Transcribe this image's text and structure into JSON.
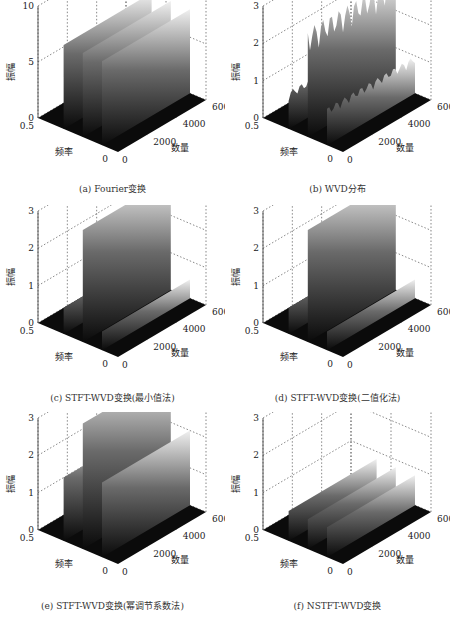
{
  "figure": {
    "panels": [
      {
        "id": "a",
        "caption": "(a) Fourier变换"
      },
      {
        "id": "b",
        "caption": "(b) WVD分布"
      },
      {
        "id": "c",
        "caption": "(c) STFT-WVD变换(最小值法)"
      },
      {
        "id": "d",
        "caption": "(d) STFT-WVD变换(二值化法)"
      },
      {
        "id": "e",
        "caption": "(e) STFT-WVD变换(幂调节系数法)"
      },
      {
        "id": "f",
        "caption": "(f) NSTFT-WVD变换"
      }
    ]
  },
  "chart_data": [
    {
      "type": "surface3d",
      "panel": "a",
      "title": "(a) Fourier变换",
      "xlabel": "数量",
      "ylabel": "频率",
      "zlabel": "振幅",
      "xlim": [
        0,
        6000
      ],
      "ylim": [
        0,
        0.5
      ],
      "zlim": [
        0,
        10
      ],
      "xticks": [
        "0",
        "2000",
        "4000",
        "6000"
      ],
      "yticks": [
        "0",
        "0.5"
      ],
      "zticks": [
        "0",
        "5",
        "10"
      ],
      "ridges": [
        {
          "freq": 0.1,
          "x_start": 0,
          "x_end": 6000,
          "peak": 7.5
        },
        {
          "freq": 0.22,
          "x_start": 0,
          "x_end": 6000,
          "peak": 7.5
        },
        {
          "freq": 0.34,
          "x_start": 0,
          "x_end": 6000,
          "peak": 7.5
        }
      ],
      "style": "smooth"
    },
    {
      "type": "surface3d",
      "panel": "b",
      "title": "(b) WVD分布",
      "xlabel": "数量",
      "ylabel": "频率",
      "zlabel": "振幅",
      "xlim": [
        0,
        6000
      ],
      "ylim": [
        0,
        0.5
      ],
      "zlim": [
        0,
        3
      ],
      "xticks": [
        "0",
        "2000",
        "4000",
        "6000"
      ],
      "yticks": [
        "0",
        "0.5"
      ],
      "zticks": [
        "0",
        "1",
        "2",
        "3"
      ],
      "ridges": [
        {
          "freq": 0.1,
          "x_start": 0,
          "x_end": 6000,
          "peak": 1.0
        },
        {
          "freq": 0.22,
          "x_start": 0,
          "x_end": 6000,
          "peak": 2.9
        },
        {
          "freq": 0.34,
          "x_start": 0,
          "x_end": 6000,
          "peak": 1.0
        }
      ],
      "style": "noisy"
    },
    {
      "type": "surface3d",
      "panel": "c",
      "title": "(c) STFT-WVD变换(最小值法)",
      "xlabel": "数量",
      "ylabel": "频率",
      "zlabel": "振幅",
      "xlim": [
        0,
        6000
      ],
      "ylim": [
        0,
        0.5
      ],
      "zlim": [
        0,
        3
      ],
      "xticks": [
        "0",
        "2000",
        "4000",
        "6000"
      ],
      "yticks": [
        "0",
        "0.5"
      ],
      "zticks": [
        "0",
        "1",
        "2",
        "3"
      ],
      "ridges": [
        {
          "freq": 0.1,
          "x_start": 0,
          "x_end": 6000,
          "peak": 0.5
        },
        {
          "freq": 0.22,
          "x_start": 0,
          "x_end": 6000,
          "peak": 3.0
        },
        {
          "freq": 0.34,
          "x_start": 0,
          "x_end": 6000,
          "peak": 0.7
        }
      ],
      "style": "smooth"
    },
    {
      "type": "surface3d",
      "panel": "d",
      "title": "(d) STFT-WVD变换(二值化法)",
      "xlabel": "数量",
      "ylabel": "频率",
      "zlabel": "振幅",
      "xlim": [
        0,
        6000
      ],
      "ylim": [
        0,
        0.5
      ],
      "zlim": [
        0,
        3
      ],
      "xticks": [
        "0",
        "2000",
        "4000",
        "6000"
      ],
      "yticks": [
        "0",
        "0.5"
      ],
      "zticks": [
        "0",
        "1",
        "2",
        "3"
      ],
      "ridges": [
        {
          "freq": 0.1,
          "x_start": 0,
          "x_end": 6000,
          "peak": 0.5
        },
        {
          "freq": 0.22,
          "x_start": 0,
          "x_end": 6000,
          "peak": 3.0
        },
        {
          "freq": 0.34,
          "x_start": 0,
          "x_end": 6000,
          "peak": 0.7
        }
      ],
      "style": "smooth"
    },
    {
      "type": "surface3d",
      "panel": "e",
      "title": "(e) STFT-WVD变换(幂调节系数法)",
      "xlabel": "数量",
      "ylabel": "频率",
      "zlabel": "振幅",
      "xlim": [
        0,
        6000
      ],
      "ylim": [
        0,
        0.5
      ],
      "zlim": [
        0,
        3
      ],
      "xticks": [
        "0",
        "2000",
        "4000",
        "6000"
      ],
      "yticks": [
        "0",
        "0.5"
      ],
      "zticks": [
        "0",
        "1",
        "2",
        "3"
      ],
      "ridges": [
        {
          "freq": 0.1,
          "x_start": 0,
          "x_end": 6000,
          "peak": 2.0
        },
        {
          "freq": 0.22,
          "x_start": 0,
          "x_end": 6000,
          "peak": 3.5
        },
        {
          "freq": 0.34,
          "x_start": 0,
          "x_end": 6000,
          "peak": 1.7
        }
      ],
      "style": "smooth"
    },
    {
      "type": "surface3d",
      "panel": "f",
      "title": "(f) NSTFT-WVD变换",
      "xlabel": "数量",
      "ylabel": "频率",
      "zlabel": "振幅",
      "xlim": [
        0,
        6000
      ],
      "ylim": [
        0,
        0.5
      ],
      "zlim": [
        0,
        3
      ],
      "xticks": [
        "0",
        "2000",
        "4000",
        "6000"
      ],
      "yticks": [
        "0",
        "0.5"
      ],
      "zticks": [
        "0",
        "1",
        "2",
        "3"
      ],
      "ridges": [
        {
          "freq": 0.1,
          "x_start": 0,
          "x_end": 6000,
          "peak": 0.8
        },
        {
          "freq": 0.22,
          "x_start": 0,
          "x_end": 6000,
          "peak": 0.8
        },
        {
          "freq": 0.34,
          "x_start": 0,
          "x_end": 6000,
          "peak": 0.8
        }
      ],
      "style": "smooth"
    }
  ]
}
